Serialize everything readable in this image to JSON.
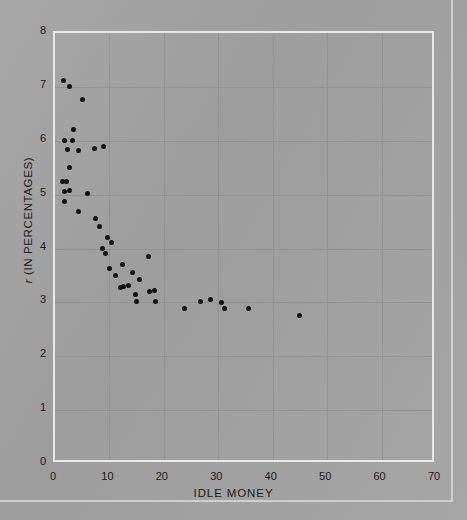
{
  "figure": {
    "background_color": "#a2a2a2",
    "frame_color": "#e8e8e8",
    "point_color": "#121212",
    "grid_color": "#8e8e8e"
  },
  "axis_label_symbol": "r",
  "axis_label_rest": "  (IN PERCENTAGES)",
  "chart_data": {
    "type": "scatter",
    "title": "",
    "xlabel": "IDLE MONEY",
    "ylabel": "r  (IN PERCENTAGES)",
    "xlim": [
      0,
      70
    ],
    "ylim": [
      0,
      8
    ],
    "xticks": [
      0,
      10,
      20,
      30,
      40,
      50,
      60,
      70
    ],
    "yticks": [
      0,
      1,
      2,
      3,
      4,
      5,
      6,
      7,
      8
    ],
    "grid": true,
    "legend": "none",
    "series": [
      {
        "name": "observations",
        "points": [
          [
            1.6,
            7.12
          ],
          [
            2.6,
            7.0
          ],
          [
            5.0,
            6.76
          ],
          [
            3.4,
            6.2
          ],
          [
            1.7,
            6.0
          ],
          [
            3.3,
            6.0
          ],
          [
            2.3,
            5.83
          ],
          [
            4.4,
            5.82
          ],
          [
            7.3,
            5.85
          ],
          [
            2.6,
            5.5
          ],
          [
            9.0,
            5.9
          ],
          [
            1.4,
            5.25
          ],
          [
            2.1,
            5.25
          ],
          [
            1.7,
            5.05
          ],
          [
            2.6,
            5.08
          ],
          [
            1.8,
            4.88
          ],
          [
            6.0,
            5.02
          ],
          [
            4.4,
            4.68
          ],
          [
            7.4,
            4.55
          ],
          [
            8.2,
            4.4
          ],
          [
            9.6,
            4.2
          ],
          [
            10.3,
            4.12
          ],
          [
            8.8,
            4.0
          ],
          [
            9.2,
            3.9
          ],
          [
            10.0,
            3.62
          ],
          [
            12.4,
            3.7
          ],
          [
            11.2,
            3.5
          ],
          [
            12.0,
            3.28
          ],
          [
            12.6,
            3.3
          ],
          [
            13.5,
            3.32
          ],
          [
            15.5,
            3.42
          ],
          [
            17.2,
            3.86
          ],
          [
            14.2,
            3.55
          ],
          [
            14.8,
            3.15
          ],
          [
            15.0,
            3.02
          ],
          [
            18.5,
            3.02
          ],
          [
            17.4,
            3.2
          ],
          [
            18.3,
            3.22
          ],
          [
            23.8,
            2.88
          ],
          [
            26.8,
            3.02
          ],
          [
            28.6,
            3.05
          ],
          [
            30.6,
            3.0
          ],
          [
            31.2,
            2.88
          ],
          [
            35.5,
            2.88
          ],
          [
            45.0,
            2.76
          ]
        ]
      }
    ]
  }
}
